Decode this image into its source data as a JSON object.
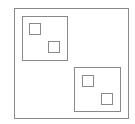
{
  "diagram": {
    "stroke_color": "#8a8a8a",
    "background": "#ffffff",
    "outer": {
      "x": 14,
      "y": 8,
      "w": 115,
      "h": 111
    },
    "groups": [
      {
        "box": {
          "x": 22,
          "y": 16,
          "w": 46,
          "h": 45
        },
        "items": [
          {
            "x": 29,
            "y": 23,
            "w": 12,
            "h": 12
          },
          {
            "x": 48,
            "y": 41,
            "w": 12,
            "h": 12
          }
        ]
      },
      {
        "box": {
          "x": 74,
          "y": 67,
          "w": 47,
          "h": 45
        },
        "items": [
          {
            "x": 82,
            "y": 75,
            "w": 12,
            "h": 12
          },
          {
            "x": 101,
            "y": 93,
            "w": 12,
            "h": 12
          }
        ]
      }
    ]
  }
}
